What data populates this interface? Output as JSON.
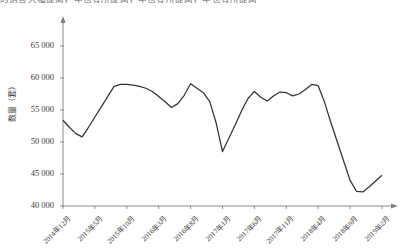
{
  "top_fragment": "的销售大幅提高，年也有所提高，年也有所提高，年也有所提高",
  "axis": {
    "ylabel": "数量（套）",
    "xlabel": "",
    "y_ticks": [
      "40 000",
      "45 000",
      "50 000",
      "55 000",
      "60 000",
      "65 000"
    ],
    "y_tick_values": [
      40000,
      45000,
      50000,
      55000,
      60000,
      65000
    ],
    "x_ticks": [
      "2014年12月",
      "2015年5月",
      "2015年10月",
      "2016年3月",
      "2016年8月",
      "2017年1月",
      "2017年6月",
      "2017年11月",
      "2018年4月",
      "2018年9月",
      "2019年2月"
    ]
  },
  "style": {
    "line_color": "#333333",
    "axis_color": "#808080",
    "background": "#ffffff"
  },
  "chart_data": {
    "type": "line",
    "title": "",
    "xlabel": "",
    "ylabel": "数量（套）",
    "ylim": [
      40000,
      65000
    ],
    "grid": false,
    "legend": "none",
    "tick_interval_months": 5,
    "x_tick_labels": [
      "2014年12月",
      "2015年5月",
      "2015年10月",
      "2016年3月",
      "2016年8月",
      "2017年1月",
      "2017年6月",
      "2017年11月",
      "2018年4月",
      "2018年9月",
      "2019年2月"
    ],
    "x": [
      "2014年12月",
      "2015年1月",
      "2015年2月",
      "2015年3月",
      "2015年4月",
      "2015年5月",
      "2015年6月",
      "2015年7月",
      "2015年8月",
      "2015年9月",
      "2015年10月",
      "2015年11月",
      "2015年12月",
      "2016年1月",
      "2016年2月",
      "2016年3月",
      "2016年4月",
      "2016年5月",
      "2016年6月",
      "2016年7月",
      "2016年8月",
      "2016年9月",
      "2016年10月",
      "2016年11月",
      "2016年12月",
      "2017年1月",
      "2017年2月",
      "2017年3月",
      "2017年4月",
      "2017年5月",
      "2017年6月",
      "2017年7月",
      "2017年8月",
      "2017年9月",
      "2017年10月",
      "2017年11月",
      "2017年12月",
      "2018年1月",
      "2018年2月",
      "2018年3月",
      "2018年4月",
      "2018年5月",
      "2018年6月",
      "2018年7月",
      "2018年8月",
      "2018年9月",
      "2018年10月",
      "2018年11月",
      "2018年12月",
      "2019年1月",
      "2019年2月"
    ],
    "values": [
      53400,
      52300,
      51300,
      50800,
      52300,
      53900,
      55500,
      57100,
      58700,
      59000,
      59000,
      58900,
      58700,
      58400,
      57900,
      57100,
      56300,
      55400,
      56000,
      57300,
      59100,
      58400,
      57700,
      56300,
      53000,
      48500,
      50600,
      52700,
      54900,
      56800,
      57900,
      57000,
      56400,
      57200,
      57800,
      57700,
      57200,
      57500,
      58200,
      59000,
      58800,
      56200,
      53000,
      50000,
      47000,
      44000,
      42300,
      42200,
      43000,
      43900,
      44800
    ]
  }
}
